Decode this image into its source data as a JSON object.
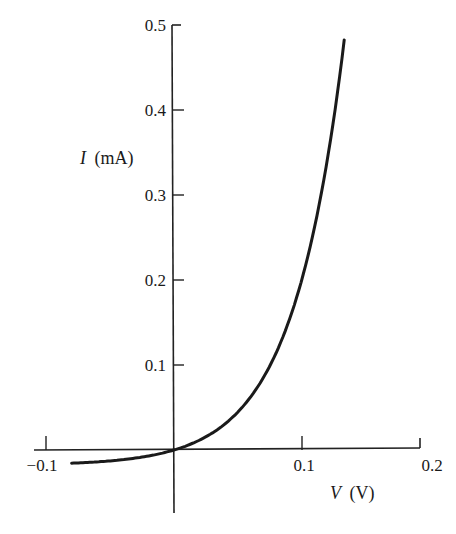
{
  "chart_data": {
    "type": "line",
    "title": "",
    "xlabel": "V (V)",
    "ylabel": "I (mA)",
    "xlabel_var": "V",
    "xlabel_unit": "(V)",
    "ylabel_var": "I",
    "ylabel_unit": "(mA)",
    "xlim": [
      -0.11,
      0.2
    ],
    "ylim": [
      -0.07,
      0.5
    ],
    "grid": false,
    "legend": "none",
    "x_ticks": [
      -0.1,
      0.1,
      0.2
    ],
    "x_tick_labels": [
      "−0.1",
      "0.1",
      "0.2"
    ],
    "y_ticks": [
      0.1,
      0.2,
      0.3,
      0.4,
      0.5
    ],
    "y_tick_labels": [
      "0.1",
      "0.2",
      "0.3",
      "0.4",
      "0.5"
    ],
    "series": [
      {
        "name": "diode I-V",
        "model": "I = 0.018 * (exp(V/0.040) - 1)",
        "x": [
          -0.08,
          -0.06,
          -0.04,
          -0.02,
          0.0,
          0.02,
          0.03,
          0.04,
          0.055,
          0.06,
          0.078,
          0.08,
          0.097,
          0.1,
          0.104,
          0.11,
          0.12,
          0.127,
          0.133
        ],
        "y": [
          -0.018,
          -0.014,
          -0.011,
          -0.007,
          0.0,
          0.012,
          0.018,
          0.031,
          0.059,
          0.063,
          0.106,
          0.115,
          0.165,
          0.201,
          0.2,
          0.264,
          0.343,
          0.4,
          0.49
        ]
      }
    ]
  }
}
